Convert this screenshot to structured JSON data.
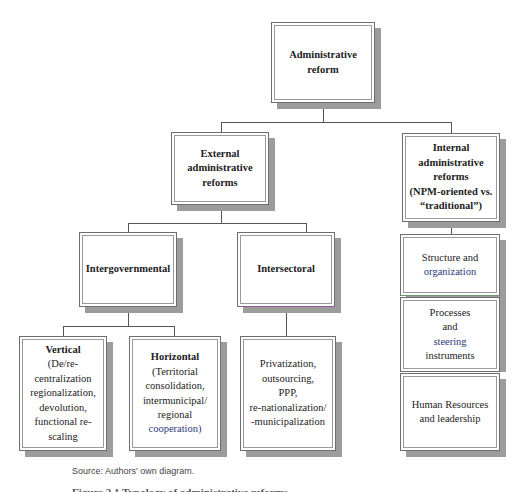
{
  "diagram": {
    "root": {
      "label": "Administrative reform"
    },
    "level1": [
      {
        "id": "external",
        "label_lines": [
          "External",
          "administrative",
          "reforms"
        ]
      },
      {
        "id": "internal",
        "label_lines": [
          "Internal",
          "administrative",
          "reforms",
          "(NPM-oriented vs.",
          "“traditional”)"
        ]
      }
    ],
    "external_children": [
      {
        "id": "intergovernmental",
        "label": "Intergovernmental"
      },
      {
        "id": "intersectoral",
        "label": "Intersectoral"
      }
    ],
    "intergovernmental_children": [
      {
        "id": "vertical",
        "title": "Vertical",
        "lines": [
          "(De/re-centralization",
          "regionalization,",
          "devolution,",
          "functional re-scaling"
        ]
      },
      {
        "id": "horizontal",
        "title": "Horizontal",
        "lines": [
          "(Territorial",
          "consolidation,",
          "intermunicipal/",
          "regional",
          "cooperation)"
        ]
      }
    ],
    "intersectoral_child": {
      "lines": [
        "Privatization,",
        "outsourcing,",
        "PPP,",
        "re-nationalization/",
        "-municipalization"
      ]
    },
    "internal_children": [
      {
        "id": "structure",
        "lines": [
          "Structure and",
          "organization"
        ]
      },
      {
        "id": "processes",
        "lines": [
          "Processes",
          "and",
          "steering",
          "instruments"
        ]
      },
      {
        "id": "hr",
        "lines": [
          "Human Resources",
          "and leadership"
        ]
      }
    ]
  },
  "source": "Source: Authors' own diagram.",
  "caption": "Figure 2.1 Typology of administrative reforms"
}
